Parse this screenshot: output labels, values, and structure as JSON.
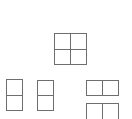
{
  "layouts": {
    "grid_2x2": {
      "label": "2x2 grid layout",
      "x": 54,
      "y": 33,
      "w": 33,
      "h": 32
    },
    "vertical_split_1": {
      "label": "Top/bottom split layout",
      "x": 6,
      "y": 79,
      "w": 17,
      "h": 32
    },
    "vertical_split_2": {
      "label": "Top/bottom split layout",
      "x": 37,
      "y": 80,
      "w": 17,
      "h": 31
    },
    "horizontal_split_1": {
      "label": "Left/right split layout",
      "x": 86,
      "y": 80,
      "w": 33,
      "h": 16
    },
    "horizontal_split_2": {
      "label": "Left/right split layout",
      "x": 86,
      "y": 103,
      "w": 33,
      "h": 17
    }
  },
  "colors": {
    "line": "#6e6e6e",
    "background": "#ffffff"
  }
}
